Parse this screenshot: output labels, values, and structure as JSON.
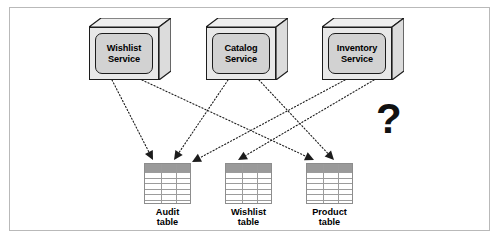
{
  "figure": {
    "question_mark": "?",
    "frame_color": "#b9b9b9",
    "background": "#ffffff",
    "line_color": "#1c1c1c",
    "box_fill": "#d2d2d2",
    "table_header_fill": "#9a9a9a"
  },
  "services": [
    {
      "id": "wishlist-service",
      "label": "Wishlist\nService",
      "x": 89,
      "y": 18
    },
    {
      "id": "catalog-service",
      "label": "Catalog\nService",
      "x": 206,
      "y": 18
    },
    {
      "id": "inventory-service",
      "label": "Inventory\nService",
      "x": 322,
      "y": 18
    }
  ],
  "tables": [
    {
      "id": "audit-table",
      "label": "Audit\ntable",
      "x": 144,
      "y": 163,
      "columns": 3,
      "rows": 6
    },
    {
      "id": "wishlist-table",
      "label": "Wishlist\ntable",
      "x": 225,
      "y": 163,
      "columns": 3,
      "rows": 6
    },
    {
      "id": "product-table",
      "label": "Product\ntable",
      "x": 306,
      "y": 163,
      "columns": 3,
      "rows": 6
    }
  ],
  "connections": [
    {
      "from": "wishlist-service",
      "to": "audit-table",
      "x1": 112,
      "y1": 80,
      "x2": 153,
      "y2": 160
    },
    {
      "from": "wishlist-service",
      "to": "product-table",
      "x1": 142,
      "y1": 80,
      "x2": 314,
      "y2": 160
    },
    {
      "from": "catalog-service",
      "to": "audit-table",
      "x1": 228,
      "y1": 80,
      "x2": 174,
      "y2": 160
    },
    {
      "from": "catalog-service",
      "to": "product-table",
      "x1": 259,
      "y1": 80,
      "x2": 334,
      "y2": 160
    },
    {
      "from": "inventory-service",
      "to": "audit-table",
      "x1": 345,
      "y1": 80,
      "x2": 192,
      "y2": 162
    },
    {
      "from": "inventory-service",
      "to": "wishlist-table",
      "x1": 374,
      "y1": 80,
      "x2": 238,
      "y2": 160
    }
  ]
}
